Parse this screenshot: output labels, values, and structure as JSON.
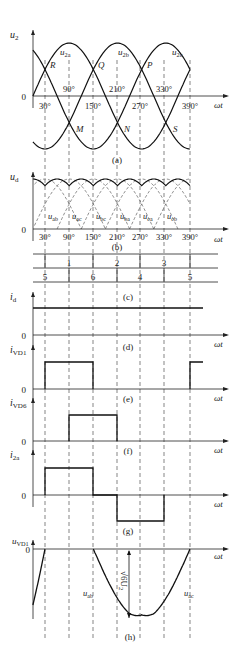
{
  "figure": {
    "angle_labels": [
      "30°",
      "90°",
      "150°",
      "210°",
      "270°",
      "330°",
      "390°"
    ],
    "axis_label_x": "ωt",
    "panels": {
      "a": {
        "caption": "(a)",
        "y_label": "u",
        "y_sub": "2",
        "zero": "0",
        "curves": [
          "u2a",
          "u2b",
          "u2c"
        ],
        "curve_labels": {
          "u2a": "2a",
          "u2b": "2b",
          "u2c": "2c"
        },
        "points_top": [
          "R",
          "Q",
          "P"
        ],
        "points_bottom": [
          "M",
          "N",
          "S"
        ],
        "top_angles": [
          "90°",
          "210°",
          "330°"
        ],
        "bottom_angles": [
          "30°",
          "150°",
          "270°",
          "390°"
        ]
      },
      "b": {
        "caption": "(b)",
        "y_label": "u",
        "y_sub": "d",
        "zero": "0",
        "segment_labels": [
          {
            "main": "u",
            "sub": "ab"
          },
          {
            "main": "u",
            "sub": "ac"
          },
          {
            "main": "u",
            "sub": "bc"
          },
          {
            "main": "u",
            "sub": "ba"
          },
          {
            "main": "u",
            "sub": "ca"
          },
          {
            "main": "u",
            "sub": "cb"
          }
        ]
      },
      "table": {
        "upper_row": [
          "1",
          "2",
          "3"
        ],
        "lower_row": [
          "5",
          "6",
          "4",
          "5"
        ]
      },
      "c": {
        "caption": "(c)",
        "y_label": "i",
        "y_sub": "d",
        "zero": "0"
      },
      "d": {
        "caption": "(d)",
        "y_label": "i",
        "y_sub": "VD1",
        "zero": "0"
      },
      "e": {
        "caption": "(e)",
        "y_label": "i",
        "y_sub": "VD6",
        "zero": "0"
      },
      "f": {
        "caption": "(f)",
        "y_label": "i",
        "y_sub": "2a",
        "zero": "0"
      },
      "g": {
        "caption": "(g)",
        "y_label": "u",
        "y_sub": "VD1",
        "zero": "0",
        "curve_left": {
          "main": "u",
          "sub": "ab"
        },
        "curve_right": {
          "main": "u",
          "sub": "ac"
        },
        "amplitude": "√6U",
        "amplitude_sub": "2"
      },
      "h": {
        "caption": "(h)"
      }
    }
  }
}
